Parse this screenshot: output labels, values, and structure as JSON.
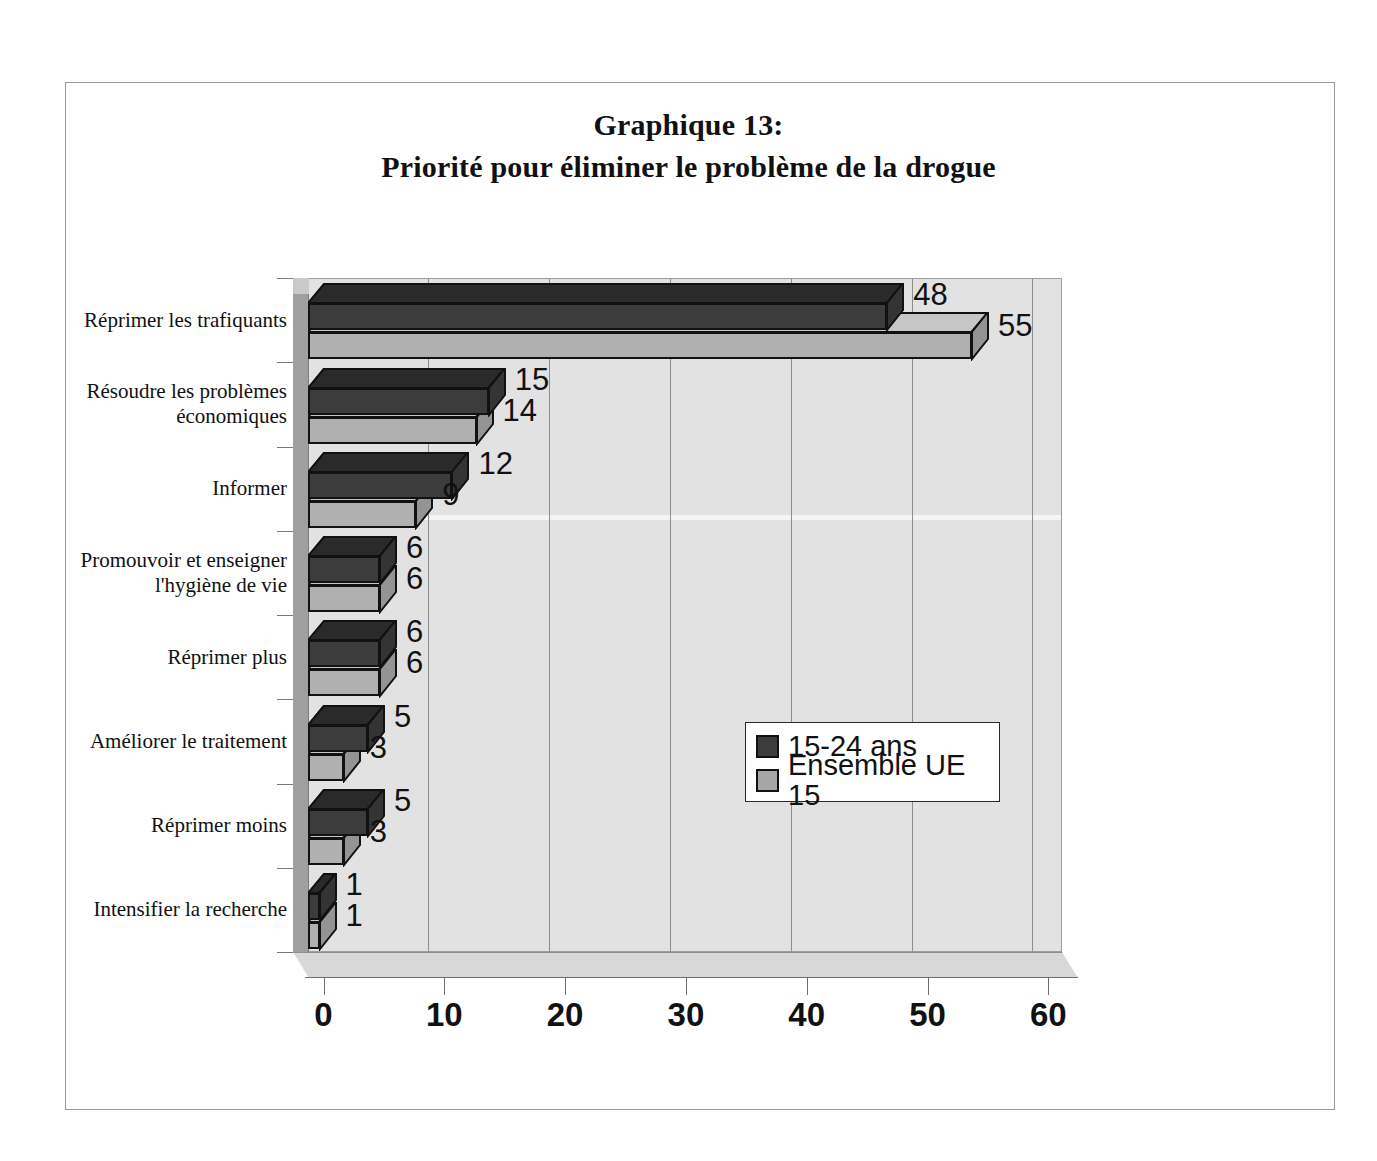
{
  "figure": {
    "title_line1": "Graphique 13:",
    "title_line2": "Priorité pour éliminer le problème de la drogue"
  },
  "legend": {
    "items": [
      {
        "label": "15-24 ans",
        "color": "#3c3c3c"
      },
      {
        "label": "Ensemble UE 15",
        "color": "#a6a6a6"
      }
    ]
  },
  "axis": {
    "x_ticks": [
      "0",
      "10",
      "20",
      "30",
      "40",
      "50",
      "60"
    ]
  },
  "chart_data": {
    "type": "bar",
    "orientation": "horizontal",
    "title": "Graphique 13: Priorité pour éliminer le problème de la drogue",
    "xlabel": "",
    "ylabel": "",
    "xlim": [
      0,
      60
    ],
    "grid": true,
    "legend_position": "center-right",
    "categories": [
      "Réprimer les trafiquants",
      "Résoudre les problèmes économiques",
      "Informer",
      "Promouvoir et enseigner l'hygiène de vie",
      "Réprimer plus",
      "Améliorer le traitement",
      "Réprimer moins",
      "Intensifier la recherche"
    ],
    "categories_display": [
      [
        "Réprimer les trafiquants"
      ],
      [
        "Résoudre les problèmes",
        "économiques"
      ],
      [
        "Informer"
      ],
      [
        "Promouvoir et enseigner",
        "l'hygiène de vie"
      ],
      [
        "Réprimer plus"
      ],
      [
        "Améliorer le traitement"
      ],
      [
        "Réprimer moins"
      ],
      [
        "Intensifier la recherche"
      ]
    ],
    "series": [
      {
        "name": "15-24 ans",
        "color": "#3c3c3c",
        "values": [
          48,
          15,
          12,
          6,
          6,
          5,
          5,
          1
        ]
      },
      {
        "name": "Ensemble UE 15",
        "color": "#a6a6a6",
        "values": [
          55,
          14,
          9,
          6,
          6,
          3,
          3,
          1
        ]
      }
    ]
  }
}
